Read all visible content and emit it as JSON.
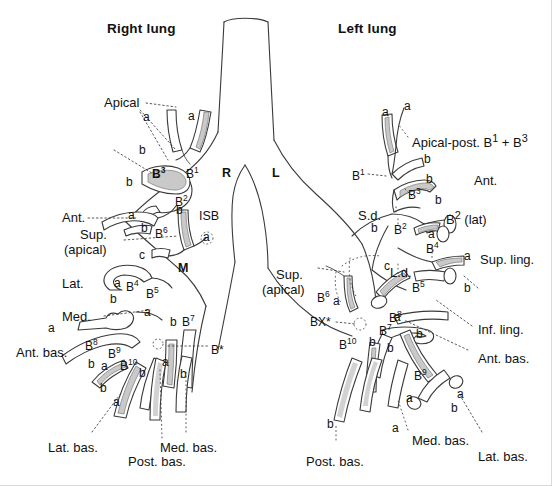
{
  "figure": {
    "title_right": "Right lung",
    "title_left": "Left lung",
    "colors": {
      "outline": "#3a3a3a",
      "shading": "#c9c9c9",
      "text": "#111111",
      "leader": "#444444",
      "background": "#ffffff"
    }
  },
  "central": {
    "right_main_bronchus": "R",
    "left_main_bronchus": "L",
    "intermediate_stem_bronchus": "ISB",
    "middle_lobe_bronchus": "M",
    "superior_division": "S.d.",
    "lingular_division": "L.d."
  },
  "right_lung": {
    "upper_lobe": {
      "apical_label": "Apical",
      "posterior_label": "Post.",
      "anterior_label": "Ant.",
      "segments": [
        "B1",
        "B2",
        "B3"
      ],
      "subsegments": [
        "a",
        "a",
        "b",
        "b",
        "a",
        "b"
      ]
    },
    "middle_lobe": {
      "lateral_label": "Lat.",
      "medial_label": "Med.",
      "segments": [
        "B4",
        "B5"
      ],
      "subsegments": [
        "a",
        "b",
        "a",
        "b"
      ]
    },
    "lower_lobe": {
      "superior_label": "Sup.",
      "superior_label_2": "(apical)",
      "anterior_basal_label": "Ant. bas.",
      "lateral_basal_label": "Lat. bas.",
      "posterior_basal_label": "Post. bas.",
      "medial_basal_label": "Med. bas.",
      "segments": [
        "B6",
        "B7",
        "B8",
        "B9",
        "B10"
      ],
      "subapical": "B*",
      "subsegments": [
        "a",
        "b",
        "c",
        "a",
        "b",
        "a",
        "b",
        "a",
        "b",
        "a",
        "b"
      ]
    }
  },
  "left_lung": {
    "upper_lobe": {
      "apical_posterior_label": "Apical-post. B",
      "apical_posterior_sup1": "1",
      "apical_posterior_plus": " + B",
      "apical_posterior_sup2": "3",
      "anterior_label": "Ant.",
      "b2_lateral_label": "B2 (lat)",
      "segments": [
        "B1",
        "B2",
        "B3"
      ],
      "subsegments": [
        "a",
        "a",
        "b",
        "b",
        "b",
        "a"
      ]
    },
    "lingula": {
      "superior_lingular_label": "Sup. ling.",
      "inferior_lingular_label": "Inf. ling.",
      "segments": [
        "B4",
        "B5"
      ],
      "subsegments": [
        "a",
        "b",
        "a",
        "b"
      ]
    },
    "lower_lobe": {
      "superior_label": "Sup.",
      "superior_label_2": "(apical)",
      "anterior_basal_label": "Ant. bas.",
      "lateral_basal_label": "Lat. bas.",
      "posterior_basal_label": "Post. bas.",
      "medial_basal_label": "Med. bas.",
      "segments": [
        "B6",
        "B7",
        "B8",
        "B9",
        "B10"
      ],
      "subapical": "BX*",
      "subsegments": [
        "a",
        "b",
        "c",
        "a",
        "b",
        "a",
        "b",
        "a",
        "b"
      ]
    }
  },
  "labels": {
    "right_upper_a1": "a",
    "right_upper_a2": "a",
    "right_upper_b1": "b",
    "right_upper_b2": "b",
    "right_upper_a3": "a",
    "right_upper_b3": "b",
    "right_b1": "B1",
    "right_b2": "B2",
    "right_b3": "B3",
    "right_isb_a": "a",
    "right_b6": "B6",
    "right_b6_c": "c",
    "right_b4": "B4",
    "right_b4_a": "a",
    "right_b4_b": "b",
    "right_b5": "B5",
    "right_b5_a": "a",
    "right_b5_b": "b",
    "right_b7": "B7",
    "right_b7_a": "a",
    "right_b7_b": "b",
    "right_b8": "B8",
    "right_b8_a": "a",
    "right_b8_b": "b",
    "right_b9": "B9",
    "right_b9_a": "a",
    "right_b9_b": "b",
    "right_b10": "B10",
    "right_b10_a": "a",
    "right_b10_b": "b",
    "right_bstar": "B*",
    "left_a1": "a",
    "left_a2": "a",
    "left_b1": "B1",
    "left_b_top1": "b",
    "left_b_top2": "b",
    "left_b3": "B3",
    "left_b2_up": "B2",
    "left_b2_b": "b",
    "left_b2_a": "a",
    "left_b4": "B4",
    "left_b4_a": "a",
    "left_b4_b": "b",
    "left_b5": "B5",
    "left_b5_a": "a",
    "left_b5_b": "b",
    "left_b6": "B6",
    "left_b6_a": "a",
    "left_b6_c": "c",
    "left_b7": "B7",
    "left_b7_b": "b",
    "left_b8": "B8",
    "left_b8_b": "b",
    "left_b9": "B9",
    "left_b9_a": "a",
    "left_b9_b": "b",
    "left_b10": "B10",
    "left_b10_b": "b",
    "left_bot_a1": "a",
    "left_bot_a2": "a",
    "left_bot_a3": "a",
    "left_bot_b1": "b"
  }
}
